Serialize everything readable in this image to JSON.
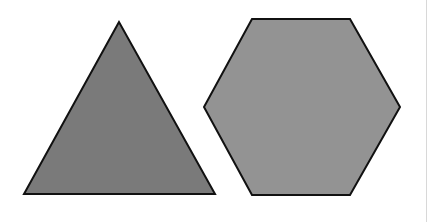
{
  "shapes": [
    {
      "name": "triangle",
      "points": "119,22 24,194 215,194",
      "fill": "#7a7a7a",
      "stroke": "#111111"
    },
    {
      "name": "hexagon",
      "points": "252,19 350,19 400,107 350,195 252,195 204,107",
      "fill": "#939393",
      "stroke": "#111111"
    }
  ],
  "colors": {
    "background": "#ffffff",
    "edge_line": "#d8d8d8"
  }
}
